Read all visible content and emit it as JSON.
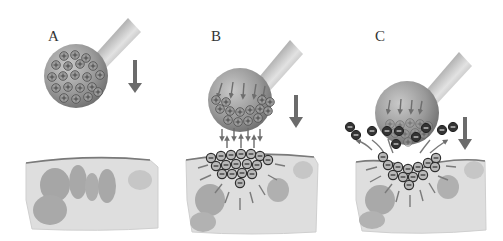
{
  "panels": [
    {
      "label": "A",
      "stage": "ion-loaded-probe-approaching"
    },
    {
      "label": "B",
      "stage": "charge-attraction-and-exchange"
    },
    {
      "label": "C",
      "stage": "negative-ions-released"
    }
  ],
  "symbols": {
    "positive": "+",
    "negative": "−"
  },
  "colors": {
    "ball": "#8f8f8f",
    "ball_highlight": "#c7c7c7",
    "tube_dark": "#5a5a5a",
    "tube_light": "#dcdcdc",
    "arrow": "#6b6b6b",
    "tissue": "#dcdcdc",
    "tissue_edge": "#7a7a7a",
    "tissue_blob": "#a4a4a4",
    "ion_outline": "#333333",
    "neg_ion_fill": "#3a3a3a"
  }
}
